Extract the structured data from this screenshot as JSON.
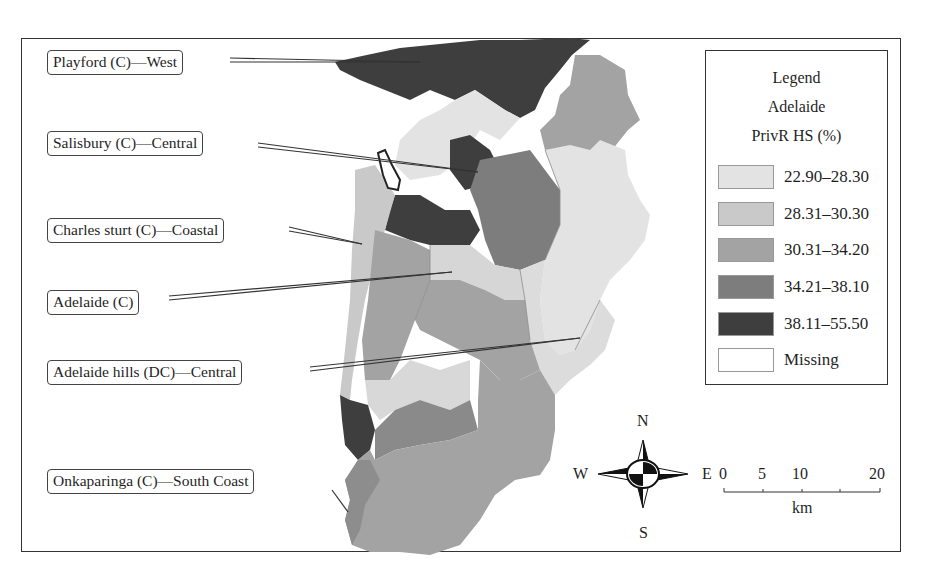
{
  "map": {
    "region": "Adelaide",
    "callouts": [
      {
        "label": "Playford (C)—West"
      },
      {
        "label": "Salisbury (C)—Central"
      },
      {
        "label": "Charles sturt (C)—Coastal"
      },
      {
        "label": "Adelaide (C)"
      },
      {
        "label": "Adelaide hills (DC)—Central"
      },
      {
        "label": "Onkaparinga (C)—South Coast"
      }
    ]
  },
  "legend": {
    "title": "Legend",
    "subtitle": "Adelaide",
    "variable": "PrivR HS (%)",
    "classes": [
      {
        "label": "22.90–28.30",
        "color": "#e3e3e3"
      },
      {
        "label": "28.31–30.30",
        "color": "#c9c9c9"
      },
      {
        "label": "30.31–34.20",
        "color": "#a3a3a3"
      },
      {
        "label": "34.21–38.10",
        "color": "#7d7d7d"
      },
      {
        "label": "38.11–55.50",
        "color": "#3e3e3e"
      },
      {
        "label": "Missing",
        "color": "#ffffff"
      }
    ]
  },
  "compass": {
    "n": "N",
    "s": "S",
    "e": "E",
    "w": "W"
  },
  "scale_bar": {
    "ticks": [
      "0",
      "5",
      "10",
      "20"
    ],
    "unit": "km"
  }
}
